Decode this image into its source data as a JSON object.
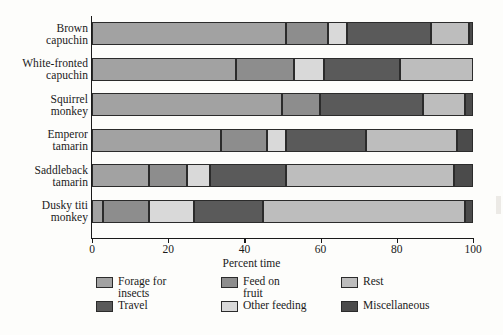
{
  "chart_data": {
    "type": "bar",
    "orientation": "horizontal",
    "stacked": true,
    "stacked_normalized": true,
    "title": "",
    "xlabel": "Percent time",
    "ylabel": "",
    "xlim": [
      0,
      100
    ],
    "xticks": [
      0,
      20,
      40,
      60,
      80,
      100
    ],
    "xtick_labels": [
      "0",
      "20",
      "40",
      "60",
      "80",
      "100"
    ],
    "grid": false,
    "legend_position": "bottom",
    "categories": [
      "Brown capuchin",
      "White-fronted capuchin",
      "Squirrel monkey",
      "Emperor tamarin",
      "Saddleback tamarin",
      "Dusky titi monkey"
    ],
    "category_lines": [
      [
        "Brown",
        "capuchin"
      ],
      [
        "White-fronted",
        "capuchin"
      ],
      [
        "Squirrel",
        "monkey"
      ],
      [
        "Emperor",
        "tamarin"
      ],
      [
        "Saddleback",
        "tamarin"
      ],
      [
        "Dusky titi",
        "monkey"
      ]
    ],
    "series": [
      {
        "name": "Forage for insects",
        "color": "#a2a2a2",
        "values": [
          51,
          38,
          50,
          34,
          15,
          3
        ]
      },
      {
        "name": "Feed on fruit",
        "color": "#8d8d8d",
        "values": [
          11,
          15,
          10,
          12,
          10,
          12
        ]
      },
      {
        "name": "Other feeding",
        "color": "#d9d9d9",
        "values": [
          5,
          8,
          0,
          5,
          6,
          12
        ]
      },
      {
        "name": "Travel",
        "color": "#5a5a5a",
        "values": [
          22,
          20,
          27,
          21,
          20,
          18
        ]
      },
      {
        "name": "Rest",
        "color": "#bdbdbd",
        "values": [
          10,
          19,
          11,
          24,
          44,
          53
        ]
      },
      {
        "name": "Miscellaneous",
        "color": "#4b4b4b",
        "values": [
          1,
          0,
          2,
          4,
          5,
          2
        ]
      }
    ]
  },
  "legend": {
    "entries": [
      {
        "label": "Forage for\ninsects",
        "name": "forage-for-insects"
      },
      {
        "label": "Feed on\nfruit",
        "name": "feed-on-fruit"
      },
      {
        "label": "Rest",
        "name": "rest"
      },
      {
        "label": "Travel",
        "name": "travel"
      },
      {
        "label": "Other feeding",
        "name": "other-feeding"
      },
      {
        "label": "Miscellaneous",
        "name": "miscellaneous"
      }
    ],
    "order_colors": [
      "#a2a2a2",
      "#8d8d8d",
      "#bdbdbd",
      "#5a5a5a",
      "#d9d9d9",
      "#4b4b4b"
    ]
  },
  "colors": {
    "axis": "#1a1a1a",
    "segment_border": "#2b2b2b",
    "background": "#fdfdfb"
  }
}
